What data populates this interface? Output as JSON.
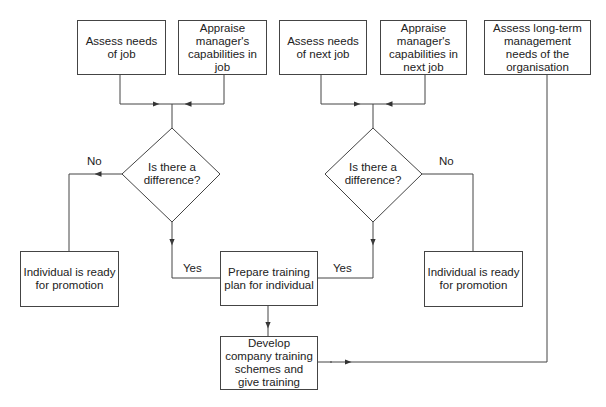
{
  "diagram": {
    "type": "flowchart",
    "nodes": {
      "assess_job": "Assess needs of job",
      "appraise_job": "Appraise manager's capabilities in job",
      "assess_next_job": "Assess needs of next job",
      "appraise_next_job": "Appraise manager's capabilities in next job",
      "assess_long_term": "Assess long-term management needs of the organisation",
      "decision_left": "Is there a difference?",
      "decision_right": "Is there a difference?",
      "ready_left": "Individual is ready for promotion",
      "ready_right": "Individual is ready for promotion",
      "prepare_plan": "Prepare training plan for individual",
      "develop_schemes": "Develop company training schemes and give training"
    },
    "edge_labels": {
      "no_left": "No",
      "yes_left": "Yes",
      "no_right": "No",
      "yes_right": "Yes"
    },
    "line_color": "#444444"
  }
}
